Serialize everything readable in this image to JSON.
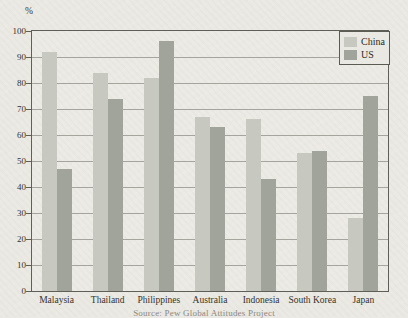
{
  "chart_data": {
    "type": "bar",
    "title": "",
    "xlabel": "",
    "ylabel": "%",
    "ylim": [
      0,
      100
    ],
    "ytick_step": 10,
    "yticks": [
      0,
      10,
      20,
      30,
      40,
      50,
      60,
      70,
      80,
      90,
      100
    ],
    "grid": true,
    "legend_position": "top-right",
    "categories": [
      "Malaysia",
      "Thailand",
      "Philippines",
      "Australia",
      "Indonesia",
      "South Korea",
      "Japan"
    ],
    "series": [
      {
        "name": "China",
        "color": "#c7c9c0",
        "values": [
          92,
          84,
          82,
          67,
          66,
          53,
          28
        ]
      },
      {
        "name": "US",
        "color": "#a0a49b",
        "values": [
          47,
          74,
          96,
          63,
          43,
          54,
          75
        ]
      }
    ]
  },
  "caption": {
    "source_text": "Source: Pew Global Attitudes Project"
  },
  "colors": {
    "paper_background": "#ebe9e3",
    "plot_frame": "#605f57",
    "gridline": "#a6a59d",
    "text": "#2e2d29",
    "caption_text": "#8b897f",
    "series_china": "#c7c9c0",
    "series_us": "#a0a49b"
  }
}
